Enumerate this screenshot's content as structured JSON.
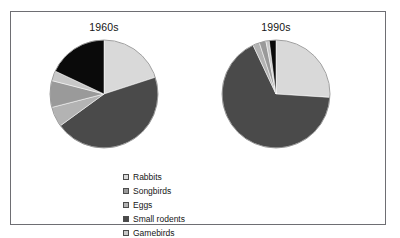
{
  "figure": {
    "border_color": "#6e6e73",
    "background": "#ffffff"
  },
  "legend": {
    "position": "bottom-center",
    "columns": [
      {
        "entries": [
          {
            "label": "Rabbits",
            "color": "#d9d9d9"
          },
          {
            "label": "Songbirds",
            "color": "#9a9a9a"
          },
          {
            "label": "Eggs",
            "color": "#b3b3b3"
          }
        ]
      },
      {
        "entries": [
          {
            "label": "Small rodents",
            "color": "#4a4a4a"
          },
          {
            "label": "Gamebirds",
            "color": "#c8c8c8"
          },
          {
            "label": "Other prey",
            "color": "#0a0a0a"
          }
        ]
      }
    ]
  },
  "chart_data": [
    {
      "type": "pie",
      "title": "1960s",
      "labels": [
        "Rabbits",
        "Small rodents",
        "Eggs",
        "Songbirds",
        "Gamebirds",
        "Other prey"
      ],
      "values": [
        20,
        45,
        6,
        8,
        3,
        18
      ],
      "colors": [
        "#d9d9d9",
        "#4a4a4a",
        "#b3b3b3",
        "#9a9a9a",
        "#c8c8c8",
        "#0a0a0a"
      ],
      "start_angle": 0,
      "direction": "clockwise",
      "units": "percent",
      "legend": "shared-bottom",
      "grid": false
    },
    {
      "type": "pie",
      "title": "1990s",
      "labels": [
        "Rabbits",
        "Small rodents",
        "Eggs",
        "Songbirds",
        "Gamebirds",
        "Other prey"
      ],
      "values": [
        26,
        67,
        2,
        2,
        1,
        2
      ],
      "colors": [
        "#d9d9d9",
        "#4a4a4a",
        "#b3b3b3",
        "#9a9a9a",
        "#c8c8c8",
        "#0a0a0a"
      ],
      "start_angle": 0,
      "direction": "clockwise",
      "units": "percent",
      "legend": "shared-bottom",
      "grid": false
    }
  ]
}
